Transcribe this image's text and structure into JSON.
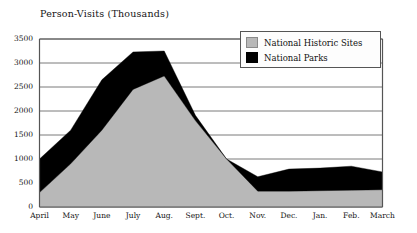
{
  "chart_data": {
    "type": "area",
    "title": "Person-Visits (Thousands)",
    "xlabel": "",
    "ylabel": "",
    "stacked": true,
    "grid": true,
    "legend_position": "top-right",
    "ylim": [
      0,
      3500
    ],
    "yticks": [
      0,
      500,
      1000,
      1500,
      2000,
      2500,
      3000,
      3500
    ],
    "ytick_labels": [
      "0",
      "500",
      "1000",
      "1500",
      "2000",
      "2500",
      "3000",
      "3500"
    ],
    "categories": [
      "April",
      "May",
      "June",
      "July",
      "Aug.",
      "Sept.",
      "Oct.",
      "Nov.",
      "Dec.",
      "Jan.",
      "Feb.",
      "March"
    ],
    "series": [
      {
        "name": "National Historic Sites",
        "color": "#b8b8b8",
        "values": [
          300,
          900,
          1600,
          2450,
          2730,
          1800,
          1000,
          330,
          330,
          340,
          350,
          360
        ]
      },
      {
        "name": "National Parks",
        "color": "#000000",
        "values": [
          700,
          700,
          1050,
          780,
          520,
          110,
          0,
          300,
          460,
          470,
          500,
          370
        ]
      }
    ],
    "totals": [
      1000,
      1600,
      2650,
      3230,
      3250,
      1910,
      1000,
      630,
      790,
      810,
      850,
      730
    ]
  },
  "legend": {
    "items": [
      {
        "label": "National Historic Sites",
        "color": "#b8b8b8"
      },
      {
        "label": "National Parks",
        "color": "#000000"
      }
    ]
  },
  "axes": {
    "y_labels": [
      "3500",
      "3000",
      "2500",
      "2000",
      "1500",
      "1000",
      "500",
      "0"
    ],
    "x_labels": [
      "April",
      "May",
      "June",
      "July",
      "Aug.",
      "Sept.",
      "Oct.",
      "Nov.",
      "Dec.",
      "Jan.",
      "Feb.",
      "March"
    ]
  },
  "colors": {
    "historic_sites": "#b8b8b8",
    "national_parks": "#000000",
    "axis": "#555555",
    "grid": "#6b6b6b",
    "text": "#141414",
    "background": "#ffffff"
  }
}
